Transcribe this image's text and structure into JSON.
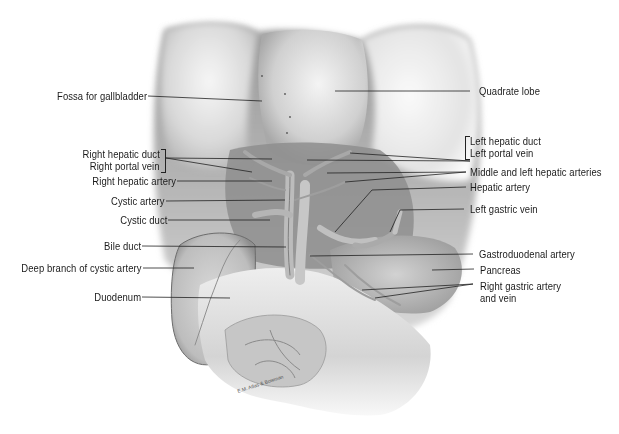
{
  "figure": {
    "artist_signature": "E.M. Atlas & Bowman"
  },
  "labels_left": [
    {
      "id": "fossa-gallbladder",
      "text": "Fossa for gallbladder"
    },
    {
      "id": "right-hepatic-duct",
      "text": "Right hepatic duct"
    },
    {
      "id": "right-portal-vein",
      "text": "Right portal vein"
    },
    {
      "id": "right-hepatic-artery",
      "text": "Right hepatic artery"
    },
    {
      "id": "cystic-artery",
      "text": "Cystic artery"
    },
    {
      "id": "cystic-duct",
      "text": "Cystic duct"
    },
    {
      "id": "bile-duct",
      "text": "Bile duct"
    },
    {
      "id": "deep-branch-cystic-artery",
      "text": "Deep branch of cystic artery"
    },
    {
      "id": "duodenum",
      "text": "Duodenum"
    }
  ],
  "labels_right": [
    {
      "id": "quadrate-lobe",
      "text": "Quadrate lobe"
    },
    {
      "id": "left-hepatic-duct",
      "text": "Left hepatic duct"
    },
    {
      "id": "left-portal-vein",
      "text": "Left portal vein"
    },
    {
      "id": "middle-left-hepatic-arteries",
      "text": "Middle and left hepatic arteries"
    },
    {
      "id": "hepatic-artery",
      "text": "Hepatic artery"
    },
    {
      "id": "left-gastric-vein",
      "text": "Left gastric vein"
    },
    {
      "id": "gastroduodenal-artery",
      "text": "Gastroduodenal artery"
    },
    {
      "id": "pancreas",
      "text": "Pancreas"
    },
    {
      "id": "right-gastric-artery-vein-1",
      "text": "Right gastric artery"
    },
    {
      "id": "right-gastric-artery-vein-2",
      "text": "and vein"
    }
  ]
}
